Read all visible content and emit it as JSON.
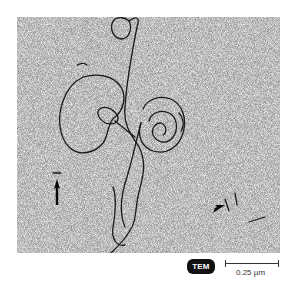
{
  "figure": {
    "type": "TEM micrograph",
    "badge_label": "TEM",
    "scale_bar_label": "0.25 µm",
    "arrows": [
      {
        "position": "left",
        "direction": "up"
      },
      {
        "position": "lower-right",
        "direction": "up-right"
      }
    ],
    "colors": {
      "background_gray": "#9a9a9a",
      "strand": "#1a1a1a",
      "badge": "#111111"
    }
  }
}
